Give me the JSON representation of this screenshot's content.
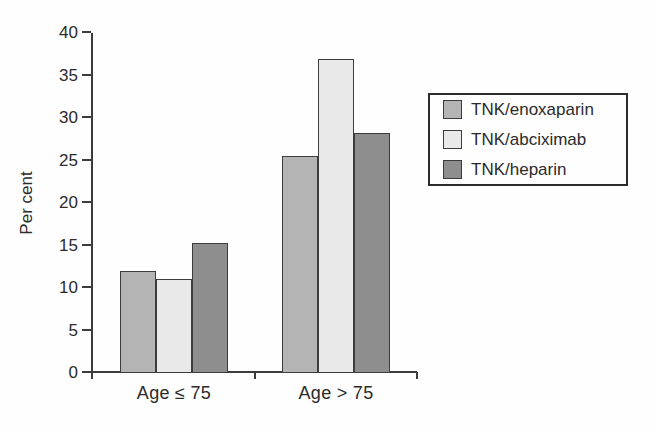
{
  "chart_data": {
    "type": "bar",
    "title": "",
    "ylabel": "Per cent",
    "xlabel": "",
    "ylim": [
      0,
      40
    ],
    "yticks": [
      0,
      5,
      10,
      15,
      20,
      25,
      30,
      35,
      40
    ],
    "categories": [
      "Age ≤ 75",
      "Age > 75"
    ],
    "series": [
      {
        "name": "TNK/enoxaparin",
        "color": "#b4b4b4",
        "values": [
          12,
          25.5
        ]
      },
      {
        "name": "TNK/abciximab",
        "color": "#e9e9e9",
        "values": [
          11.1,
          37
        ]
      },
      {
        "name": "TNK/heparin",
        "color": "#8e8e8e",
        "values": [
          15.3,
          28.2
        ]
      }
    ],
    "legend": {
      "position": "right",
      "entries": [
        "TNK/enoxaparin",
        "TNK/abciximab",
        "TNK/heparin"
      ]
    },
    "grid": false,
    "colors": {
      "axis": "#3c3c3c",
      "text": "#2b2b2b",
      "bar_border": "#3c3c3c",
      "legend_border": "#2b2b2b",
      "background": "#fefefe"
    }
  }
}
